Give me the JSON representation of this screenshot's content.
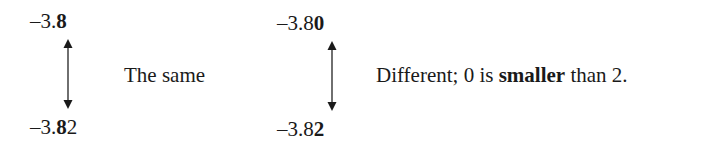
{
  "example_1": {
    "top": {
      "prefix": "–3.",
      "bold": "8",
      "suffix": ""
    },
    "bottom": {
      "prefix": "–3.",
      "bold": "8",
      "suffix": "2"
    },
    "label": "The same"
  },
  "example_2": {
    "top": {
      "prefix": "–3.8",
      "bold": "0",
      "suffix": ""
    },
    "bottom": {
      "prefix": "–3.8",
      "bold": "2",
      "suffix": ""
    },
    "label_prefix": "Different; 0 is ",
    "label_bold": "smaller",
    "label_suffix": " than 2."
  },
  "icons": {
    "arrow": "double-headed-vertical-arrow"
  }
}
